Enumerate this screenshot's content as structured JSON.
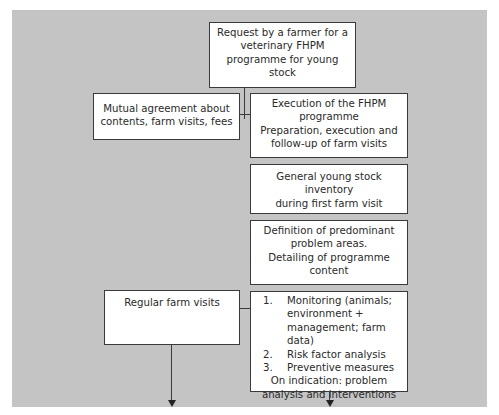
{
  "diagram": {
    "request_box": {
      "lines": [
        "Request by a farmer for a",
        "veterinary FHPM",
        "programme for young",
        "stock"
      ]
    },
    "agreement_box": {
      "lines": [
        "Mutual agreement about",
        "contents, farm visits, fees"
      ]
    },
    "execution_box": {
      "lines": [
        "Execution of the FHPM",
        "programme",
        "Preparation, execution and",
        "follow-up of farm visits"
      ]
    },
    "inventory_box": {
      "lines": [
        "General young stock",
        "inventory",
        "during first farm visit"
      ]
    },
    "definition_box": {
      "lines": [
        "Definition of predominant",
        "problem areas.",
        "Detailing of programme",
        "content"
      ]
    },
    "regular_visits_box": {
      "label": "Regular farm visits"
    },
    "monitoring_box": {
      "steps": [
        {
          "num": "1.",
          "text": "Monitoring (animals; environment + management; farm data)"
        },
        {
          "num": "2.",
          "text": "Risk factor analysis"
        },
        {
          "num": "3.",
          "text": "Preventive measures"
        }
      ],
      "footer": [
        "On indication: problem",
        "analysis and interventions"
      ]
    }
  },
  "colors": {
    "background": "#c4c4c4",
    "box_fill": "#ffffff",
    "border": "#3a3a3a"
  }
}
